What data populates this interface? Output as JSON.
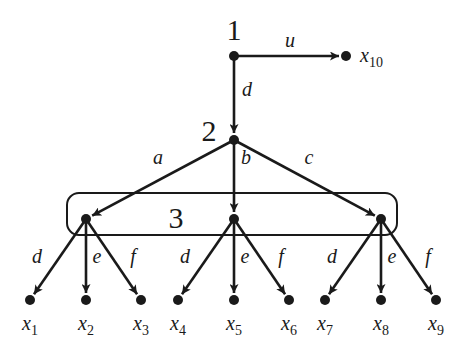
{
  "diagram": {
    "type": "game-tree",
    "decision_nodes": [
      {
        "id": "n1",
        "label": "1",
        "x": 234,
        "y": 56,
        "lx": 234,
        "ly": 40
      },
      {
        "id": "n2",
        "label": "2",
        "x": 234,
        "y": 140,
        "lx": 209,
        "ly": 141
      },
      {
        "id": "n3",
        "label": "3",
        "lx": 176,
        "ly": 228
      }
    ],
    "info_set_nodes": [
      {
        "id": "n3a",
        "x": 86,
        "y": 219
      },
      {
        "id": "n3b",
        "x": 234,
        "y": 219
      },
      {
        "id": "n3c",
        "x": 381,
        "y": 219
      }
    ],
    "edges": [
      {
        "from": "n1",
        "to": "x10",
        "label": "u",
        "lx": 290,
        "ly": 47
      },
      {
        "from": "n1",
        "to": "n2",
        "label": "d",
        "lx": 247,
        "ly": 96
      },
      {
        "from": "n2",
        "to": "n3a",
        "label": "a",
        "lx": 158,
        "ly": 164
      },
      {
        "from": "n2",
        "to": "n3b",
        "label": "b",
        "lx": 246,
        "ly": 164
      },
      {
        "from": "n2",
        "to": "n3c",
        "label": "c",
        "lx": 309,
        "ly": 164
      },
      {
        "from": "n3a",
        "to": "x1",
        "label": "d",
        "lx": 37,
        "ly": 263
      },
      {
        "from": "n3a",
        "to": "x2",
        "label": "e",
        "lx": 97,
        "ly": 263
      },
      {
        "from": "n3a",
        "to": "x3",
        "label": "f",
        "lx": 133,
        "ly": 263
      },
      {
        "from": "n3b",
        "to": "x4",
        "label": "d",
        "lx": 185,
        "ly": 263
      },
      {
        "from": "n3b",
        "to": "x5",
        "label": "e",
        "lx": 245,
        "ly": 263
      },
      {
        "from": "n3b",
        "to": "x6",
        "label": "f",
        "lx": 281,
        "ly": 263
      },
      {
        "from": "n3c",
        "to": "x7",
        "label": "d",
        "lx": 332,
        "ly": 263
      },
      {
        "from": "n3c",
        "to": "x8",
        "label": "e",
        "lx": 392,
        "ly": 263
      },
      {
        "from": "n3c",
        "to": "x9",
        "label": "f",
        "lx": 428,
        "ly": 263
      }
    ],
    "terminals": [
      {
        "id": "x1",
        "sub": "1",
        "x": 30,
        "y": 300
      },
      {
        "id": "x2",
        "sub": "2",
        "x": 86,
        "y": 300
      },
      {
        "id": "x3",
        "sub": "3",
        "x": 141,
        "y": 300
      },
      {
        "id": "x4",
        "sub": "4",
        "x": 178,
        "y": 300
      },
      {
        "id": "x5",
        "sub": "5",
        "x": 234,
        "y": 300
      },
      {
        "id": "x6",
        "sub": "6",
        "x": 289,
        "y": 300
      },
      {
        "id": "x7",
        "sub": "7",
        "x": 325,
        "y": 300
      },
      {
        "id": "x8",
        "sub": "8",
        "x": 381,
        "y": 300
      },
      {
        "id": "x9",
        "sub": "9",
        "x": 436,
        "y": 300
      },
      {
        "id": "x10",
        "sub": "10",
        "x": 346,
        "y": 56
      }
    ],
    "terminal_var": "x",
    "info_set_box": {
      "x": 67,
      "y": 193,
      "w": 330,
      "h": 42,
      "r": 12
    },
    "colors": {
      "ink": "#1a1a1a",
      "background": "#ffffff"
    }
  }
}
